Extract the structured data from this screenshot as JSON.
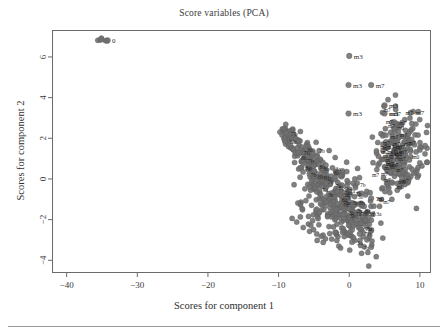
{
  "chart_data": {
    "type": "scatter",
    "title": "Score variables (PCA)",
    "xlabel": "Scores for component 1",
    "ylabel": "Scores for component 2",
    "xlim": [
      -42,
      11.5
    ],
    "ylim": [
      -4.6,
      7.3
    ],
    "xticks": [
      -40,
      -30,
      -20,
      -10,
      0,
      10
    ],
    "xticklabels": [
      "-40",
      "-30",
      "-20",
      "-10",
      "0",
      "10"
    ],
    "yticks": [
      -4,
      -2,
      0,
      2,
      4,
      6
    ],
    "yticklabels": [
      "-4",
      "-2",
      "0",
      "2",
      "4",
      "6"
    ],
    "grid": false,
    "legend": null,
    "point_color": "#6f6f6f",
    "point_edge_color": "#5a5a5a",
    "point_radius": 2.6,
    "axis_color": "#6b6b6b",
    "labeled_points": [
      {
        "x": -34.2,
        "y": 6.82,
        "label": "0",
        "bold": false
      },
      {
        "x": 0.0,
        "y": 6.05,
        "label": "m3",
        "bold": false
      },
      {
        "x": -0.1,
        "y": 4.62,
        "label": "m3",
        "bold": false
      },
      {
        "x": 3.1,
        "y": 4.62,
        "label": "m7",
        "bold": false
      },
      {
        "x": 5.0,
        "y": 3.62,
        "label": "m3",
        "bold": false
      },
      {
        "x": -0.1,
        "y": 3.22,
        "label": "m3",
        "bold": false
      },
      {
        "x": 5.0,
        "y": 3.22,
        "label": "m3",
        "bold": true
      },
      {
        "x": 8.7,
        "y": 3.25,
        "label": "m7",
        "bold": false
      },
      {
        "x": -8.9,
        "y": 2.25,
        "label": "7b",
        "bold": false
      },
      {
        "x": -9.1,
        "y": 1.85,
        "label": "3b",
        "bold": false
      },
      {
        "x": -7.2,
        "y": 1.3,
        "label": "7b",
        "bold": false
      },
      {
        "x": -6.6,
        "y": 0.92,
        "label": "7b",
        "bold": false
      },
      {
        "x": -6.9,
        "y": 0.55,
        "label": "3b",
        "bold": false
      },
      {
        "x": -5.1,
        "y": 0.12,
        "label": "8b",
        "bold": false
      },
      {
        "x": -4.2,
        "y": 0.1,
        "label": "8b",
        "bold": false
      },
      {
        "x": 3.1,
        "y": -0.95,
        "label": "7a",
        "bold": false
      },
      {
        "x": 2.6,
        "y": -1.62,
        "label": "a",
        "bold": false
      },
      {
        "x": 1.6,
        "y": -2.45,
        "label": "7b",
        "bold": false
      },
      {
        "x": 1.5,
        "y": -2.7,
        "label": "7b",
        "bold": false
      },
      {
        "x": 0.4,
        "y": -3.1,
        "label": "3a",
        "bold": false
      }
    ],
    "clusters": [
      {
        "name": "isolated-top-left",
        "n": 6,
        "center": [
          -35.0,
          6.82
        ],
        "spread": [
          0.45,
          0.06
        ],
        "description": "tight overlapping group of points at far left, near y = 6.8"
      },
      {
        "name": "diagonal-middle",
        "n": 330,
        "center": [
          -3.0,
          -1.1
        ],
        "spread": [
          3.0,
          1.1
        ],
        "description": "large elongated cluster running from upper-left (-9, 2) down to lower-right (3, -3), labelled with codes 3a/3b/7a/7b/8b"
      },
      {
        "name": "right-dense",
        "n": 200,
        "center": [
          7.2,
          1.2
        ],
        "spread": [
          1.6,
          1.0
        ],
        "description": "dense cluster at right edge between y = -0.3 and y = 3, labelled mostly m7/m0"
      },
      {
        "name": "right-outliers",
        "n": 7,
        "center": [
          3.0,
          4.2
        ],
        "spread": [
          3.0,
          1.2
        ],
        "description": "separated labelled points m3 / m7 above the right dense cluster"
      }
    ]
  }
}
